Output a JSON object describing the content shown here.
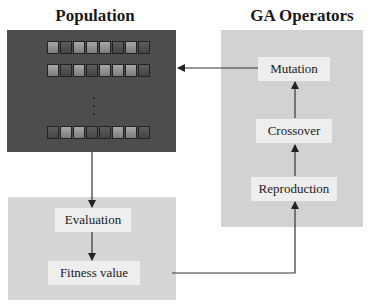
{
  "titles": {
    "population": "Population",
    "ga_operators": "GA Operators"
  },
  "population": {
    "chromosomes": [
      [
        "light",
        "dark",
        "light",
        "light",
        "light",
        "dark",
        "light",
        "dark"
      ],
      [
        "light",
        "dark",
        "light",
        "dark",
        "light",
        "light",
        "light",
        "dark"
      ],
      [
        "dark",
        "light",
        "light",
        "dark",
        "dark",
        "light",
        "light",
        "dark"
      ]
    ],
    "ellipsis": "⋮"
  },
  "evaluation_panel": {
    "evaluation": "Evaluation",
    "fitness_value": "Fitness value"
  },
  "ga_operators": {
    "mutation": "Mutation",
    "crossover": "Crossover",
    "reproduction": "Reproduction"
  },
  "colors": {
    "population_bg": "#4d4d4d",
    "operator_panel_bg": "#d2d2d2",
    "label_bg": "#eeeeee",
    "arrow": "#333333"
  }
}
